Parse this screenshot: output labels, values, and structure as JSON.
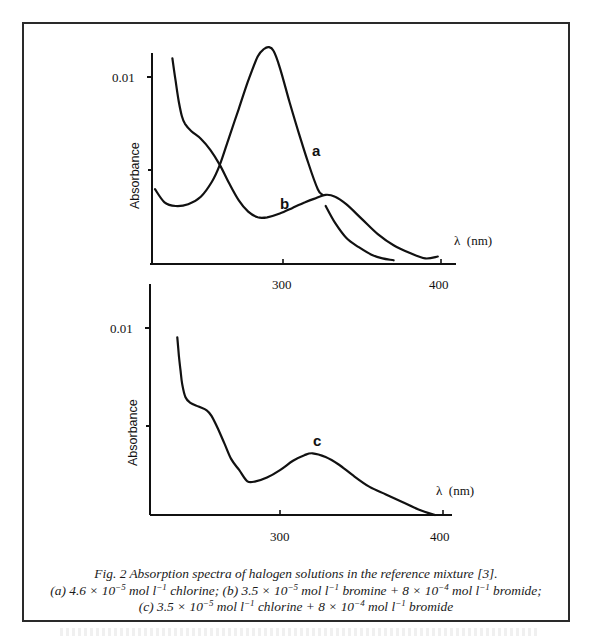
{
  "figure": {
    "number": "Fig. 2",
    "caption_title": "Fig. 2 Absorption spectra of halogen solutions in the reference mixture [3].",
    "caption_line2": {
      "a_prefix": "(a) 4.6 × 10",
      "a_exp": "−5",
      "a_mid": " mol l",
      "a_exp2": "−1",
      "a_text": " chlorine; ",
      "b_prefix": "(b) 3.5 × 10",
      "b_exp": "−5",
      "b_mid": " mol l",
      "b_exp2": "−1",
      "b_text": " bromine + 8 × 10",
      "b_exp3": "−4",
      "b_mid2": " mol l",
      "b_exp4": "−1",
      "b_end": " bromide;"
    },
    "caption_line3": {
      "c_prefix": "(c) 3.5 × 10",
      "c_exp": "−5",
      "c_mid": " mol l",
      "c_exp2": "−1",
      "c_text": " chlorine + 8 × 10",
      "c_exp3": "−4",
      "c_mid2": " mol l",
      "c_exp4": "−1",
      "c_end": " bromide"
    }
  },
  "colors": {
    "ink": "#111111",
    "frame": "#2a2a2a",
    "background": "#ffffff"
  },
  "chart_data": [
    {
      "type": "line",
      "title": "",
      "panel": "top",
      "xlabel": "λ (nm)",
      "ylabel": "Absorbance",
      "x_ticks": [
        300,
        400
      ],
      "y_ticks": [
        {
          "value": 0.005,
          "label": ""
        },
        {
          "value": 0.01,
          "label": "0.01"
        }
      ],
      "xlim": [
        218,
        410
      ],
      "ylim": [
        0,
        0.0122
      ],
      "grid": false,
      "legend": "inline curve labels",
      "series": [
        {
          "name": "a",
          "description": "4.6 × 10^-5 mol l^-1 chlorine",
          "x": [
            219,
            225,
            232,
            240,
            248,
            255,
            260,
            266,
            272,
            278,
            284,
            288,
            291,
            294,
            298,
            304,
            310,
            316,
            322,
            325
          ],
          "y": [
            0.004,
            0.0033,
            0.0031,
            0.0032,
            0.0036,
            0.0044,
            0.0053,
            0.0068,
            0.0083,
            0.0098,
            0.0111,
            0.0115,
            0.0116,
            0.0114,
            0.0105,
            0.0087,
            0.007,
            0.0054,
            0.004,
            0.0037
          ]
        },
        {
          "name": "a (tail)",
          "x": [
            327,
            333,
            340,
            348,
            356,
            363,
            370
          ],
          "y": [
            0.0031,
            0.0022,
            0.0014,
            0.0009,
            0.0005,
            0.0003,
            0.0002
          ]
        },
        {
          "name": "b",
          "description": "3.5 × 10^-5 mol l^-1 bromine + 8 × 10^-4 mol l^-1 bromide",
          "x": [
            230,
            232,
            234,
            236,
            238,
            242,
            248,
            254,
            260,
            266,
            272,
            278,
            284,
            290,
            298,
            306,
            314,
            320,
            327,
            333,
            340,
            350,
            360,
            370,
            380,
            390,
            398
          ],
          "y": [
            0.011,
            0.0098,
            0.0087,
            0.0079,
            0.0075,
            0.0071,
            0.0067,
            0.0061,
            0.0053,
            0.0043,
            0.0034,
            0.0028,
            0.0025,
            0.0025,
            0.0027,
            0.003,
            0.0033,
            0.0035,
            0.0037,
            0.0036,
            0.0032,
            0.0024,
            0.0016,
            0.001,
            0.0006,
            0.0003,
            0.0004
          ]
        }
      ],
      "annotations": [
        {
          "text": "a",
          "x": 321,
          "y": 0.0061
        },
        {
          "text": "b",
          "x": 302,
          "y": 0.0033
        }
      ]
    },
    {
      "type": "line",
      "title": "",
      "panel": "bottom",
      "xlabel": "λ (nm)",
      "ylabel": "Absorbance",
      "x_ticks": [
        300,
        400
      ],
      "y_ticks": [
        {
          "value": 0.005,
          "label": ""
        },
        {
          "value": 0.01,
          "label": "0.01"
        }
      ],
      "xlim": [
        220,
        408
      ],
      "ylim": [
        0,
        0.0122
      ],
      "grid": false,
      "legend": "inline curve labels",
      "series": [
        {
          "name": "c",
          "description": "3.5 × 10^-5 mol l^-1 chlorine + 8 × 10^-4 mol l^-1 bromide",
          "x": [
            237,
            238,
            239,
            240,
            242,
            245,
            250,
            255,
            258,
            262,
            266,
            270,
            275,
            280,
            285,
            292,
            300,
            308,
            315,
            320,
            328,
            336,
            345,
            355,
            365,
            375,
            385,
            395
          ],
          "y": [
            0.0095,
            0.0085,
            0.0077,
            0.007,
            0.0063,
            0.006,
            0.0058,
            0.0056,
            0.0053,
            0.0046,
            0.0038,
            0.003,
            0.0024,
            0.0018,
            0.0018,
            0.002,
            0.0024,
            0.0029,
            0.0032,
            0.0033,
            0.0031,
            0.0027,
            0.0021,
            0.0015,
            0.0011,
            0.0007,
            0.0003,
            0.0
          ]
        }
      ],
      "annotations": [
        {
          "text": "c",
          "x": 322,
          "y": 0.0038
        }
      ]
    }
  ],
  "panels": {
    "top": {
      "ylabel": "Absorbance",
      "y_tick_label": "0.01",
      "x_tick_300": "300",
      "x_tick_400": "400",
      "xunit_label": "λ  (nm)",
      "label_a": "a",
      "label_b": "b"
    },
    "bottom": {
      "ylabel": "Absorbance",
      "y_tick_label": "0.01",
      "x_tick_300": "300",
      "x_tick_400": "400",
      "xunit_label": "λ  (nm)",
      "label_c": "c"
    }
  }
}
